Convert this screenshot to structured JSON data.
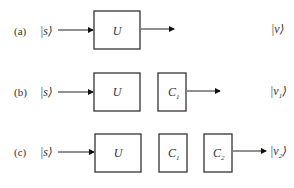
{
  "diagram": {
    "rows": [
      {
        "id": "a",
        "label": "(a)",
        "input": "|s⟩",
        "boxes": [
          {
            "main": "U",
            "sub": ""
          }
        ],
        "output": "|v⟩"
      },
      {
        "id": "b",
        "label": "(b)",
        "input": "|s⟩",
        "boxes": [
          {
            "main": "U",
            "sub": ""
          },
          {
            "main": "C",
            "sub": "1"
          }
        ],
        "output": "|v",
        "output_sub": "1",
        "output_close": "⟩"
      },
      {
        "id": "c",
        "label": "(c)",
        "input": "|s⟩",
        "boxes": [
          {
            "main": "U",
            "sub": ""
          },
          {
            "main": "C",
            "sub": "1"
          },
          {
            "main": "C",
            "sub": "2"
          }
        ],
        "output": "|v",
        "output_sub": "2",
        "output_close": "⟩"
      }
    ],
    "row_a_output": "|v⟩"
  }
}
